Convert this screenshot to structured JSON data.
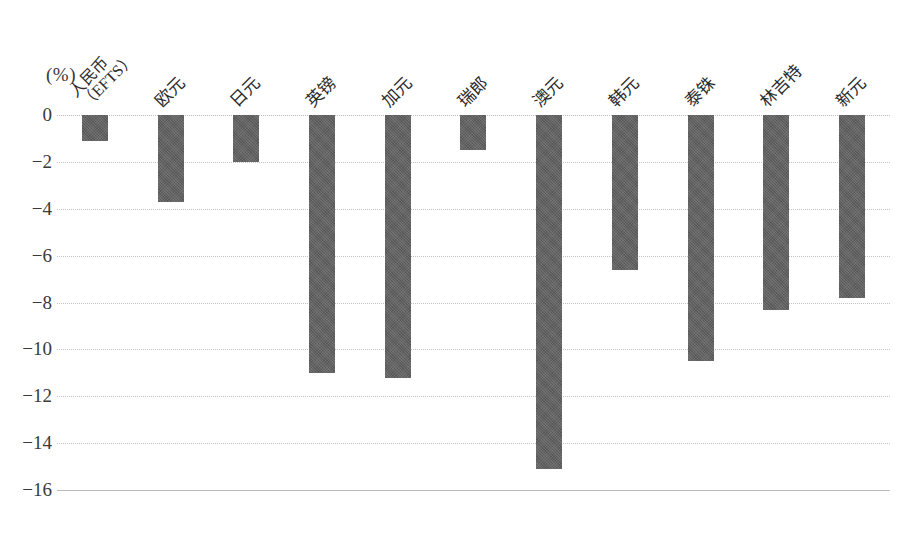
{
  "chart_data": {
    "type": "bar",
    "title": "",
    "subtitle": "",
    "xlabel": "",
    "ylabel": "",
    "unit_label": "(%)",
    "ylim": [
      -16,
      0
    ],
    "ytick_step": 2,
    "grid": true,
    "legend": "none",
    "orientation": "vertical",
    "bar_color": "#626262",
    "categories": [
      "人民币\n（EFTS）",
      "欧元",
      "日元",
      "英镑",
      "加元",
      "瑞郎",
      "澳元",
      "韩元",
      "泰铢",
      "林吉特",
      "新元"
    ],
    "values": [
      -1.1,
      -3.7,
      -2.0,
      -11.0,
      -11.2,
      -1.5,
      -15.1,
      -6.6,
      -10.5,
      -8.3,
      -7.8
    ],
    "ytick_labels": [
      "0",
      "−2",
      "−4",
      "−6",
      "−8",
      "−10",
      "−12",
      "−14",
      "−16"
    ],
    "ytick_values": [
      0,
      -2,
      -4,
      -6,
      -8,
      -10,
      -12,
      -14,
      -16
    ]
  },
  "categories_display": [
    {
      "line1": "人民币",
      "line2": "（EFTS）",
      "two_line": true
    },
    {
      "line1": "欧元",
      "line2": "",
      "two_line": false
    },
    {
      "line1": "日元",
      "line2": "",
      "two_line": false
    },
    {
      "line1": "英镑",
      "line2": "",
      "two_line": false
    },
    {
      "line1": "加元",
      "line2": "",
      "two_line": false
    },
    {
      "line1": "瑞郎",
      "line2": "",
      "two_line": false
    },
    {
      "line1": "澳元",
      "line2": "",
      "two_line": false
    },
    {
      "line1": "韩元",
      "line2": "",
      "two_line": false
    },
    {
      "line1": "泰铢",
      "line2": "",
      "two_line": false
    },
    {
      "line1": "林吉特",
      "line2": "",
      "two_line": false
    },
    {
      "line1": "新元",
      "line2": "",
      "two_line": false
    }
  ]
}
